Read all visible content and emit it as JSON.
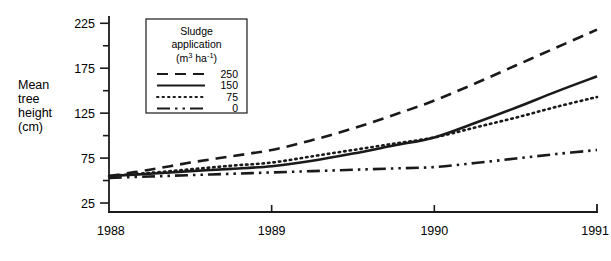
{
  "chart_data": {
    "type": "line",
    "title": "",
    "xlabel": "",
    "ylabel": "Mean tree height (cm)",
    "ylabel_lines": [
      "Mean",
      "tree",
      "height",
      "(cm)"
    ],
    "x": [
      1988,
      1989,
      1990,
      1991
    ],
    "xtick_labels": [
      "1988",
      "1989",
      "1990",
      "1991"
    ],
    "xlim": [
      1988,
      1991
    ],
    "ylim": [
      15,
      232
    ],
    "ytick_labels": [
      "25",
      "75",
      "125",
      "175",
      "225"
    ],
    "ytick_values": [
      25,
      75,
      125,
      175,
      225
    ],
    "yminor_values": [
      50,
      100,
      150,
      200
    ],
    "grid": false,
    "legend_position": "upper-left-inset",
    "legend_title_lines": [
      "Sludge",
      "application",
      "(m3 ha-1)"
    ],
    "legend_title_unit_base": "(m",
    "legend_title_unit_sup1": "3",
    "legend_title_unit_mid": " ha",
    "legend_title_unit_sup2": "-1",
    "legend_title_unit_end": ")",
    "series": [
      {
        "name": "250",
        "label": "250",
        "style": "dashed",
        "dash": "11,7",
        "values": [
          55,
          84,
          139,
          218
        ],
        "detail_x": [
          1988.0,
          1988.25,
          1988.5,
          1988.75,
          1989.0,
          1989.25,
          1989.5,
          1989.75,
          1990.0,
          1990.25,
          1990.5,
          1990.75,
          1991.0
        ],
        "detail_y": [
          55,
          62,
          70,
          77,
          84,
          95,
          108,
          123,
          139,
          158,
          178,
          198,
          218
        ]
      },
      {
        "name": "150",
        "label": "150",
        "style": "solid",
        "dash": "none",
        "values": [
          55,
          66,
          98,
          166
        ],
        "detail_x": [
          1988.0,
          1988.25,
          1988.5,
          1988.75,
          1989.0,
          1989.25,
          1989.5,
          1989.75,
          1990.0,
          1990.25,
          1990.5,
          1990.75,
          1991.0
        ],
        "detail_y": [
          55,
          57.5,
          60.5,
          63,
          66,
          72,
          80,
          89,
          98,
          114,
          131,
          149,
          166
        ]
      },
      {
        "name": "75",
        "label": "75",
        "style": "dotted",
        "dash": "1.5,4",
        "values": [
          55,
          70,
          98,
          143
        ],
        "detail_x": [
          1988.0,
          1988.25,
          1988.5,
          1988.75,
          1989.0,
          1989.25,
          1989.5,
          1989.75,
          1990.0,
          1990.25,
          1990.5,
          1990.75,
          1991.0
        ],
        "detail_y": [
          55,
          58.5,
          62.5,
          66.5,
          70,
          77,
          84,
          91,
          98,
          109,
          120,
          132,
          143
        ]
      },
      {
        "name": "0",
        "label": "0",
        "style": "dash-dot-dot",
        "dash": "13,5,2.5,5,2.5,5",
        "values": [
          53,
          59,
          65,
          84
        ],
        "detail_x": [
          1988.0,
          1988.25,
          1988.5,
          1988.75,
          1989.0,
          1989.25,
          1989.5,
          1989.75,
          1990.0,
          1990.25,
          1990.5,
          1990.75,
          1991.0
        ],
        "detail_y": [
          53,
          54.5,
          56,
          57.5,
          59,
          60.5,
          62,
          63.5,
          65,
          69.5,
          74.5,
          79.5,
          84
        ]
      }
    ]
  }
}
